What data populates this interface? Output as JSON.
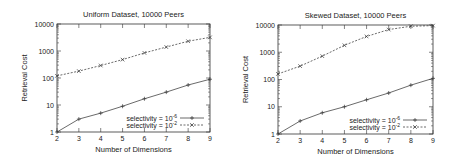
{
  "chart_data": [
    {
      "type": "line",
      "title": "Uniform Dataset, 10000 Peers",
      "xlabel": "Number of Dimensions",
      "ylabel": "Retrieval Cost",
      "yscale": "log",
      "ylim": [
        1,
        10000
      ],
      "xlim": [
        2,
        9
      ],
      "x": [
        2,
        3,
        4,
        5,
        6,
        7,
        8,
        9
      ],
      "xticks": [
        "2",
        "3",
        "4",
        "5",
        "6",
        "7",
        "8",
        "9"
      ],
      "yticks": [
        "1",
        "10",
        "100",
        "1000",
        "10000"
      ],
      "legend_position": "lower right",
      "grid": false,
      "series": [
        {
          "name": "selectivity = 10^-6",
          "style": "solid",
          "marker": "+",
          "values": [
            1,
            3,
            5,
            9,
            17,
            30,
            55,
            90
          ]
        },
        {
          "name": "selectivity = 10^-2",
          "style": "dashed",
          "marker": "x",
          "values": [
            120,
            180,
            290,
            480,
            850,
            1400,
            2300,
            3200
          ]
        }
      ]
    },
    {
      "type": "line",
      "title": "Skewed Dataset, 10000 Peers",
      "xlabel": "Number of Dimensions",
      "ylabel": "Retrieval Cost",
      "yscale": "log",
      "ylim": [
        1,
        10000
      ],
      "xlim": [
        2,
        9
      ],
      "x": [
        2,
        3,
        4,
        5,
        6,
        7,
        8,
        9
      ],
      "xticks": [
        "2",
        "3",
        "4",
        "5",
        "6",
        "7",
        "8",
        "9"
      ],
      "yticks": [
        "1",
        "10",
        "100",
        "1000",
        "10000"
      ],
      "legend_position": "lower right",
      "grid": false,
      "series": [
        {
          "name": "selectivity = 10^-6",
          "style": "solid",
          "marker": "+",
          "values": [
            1,
            3,
            6,
            10,
            18,
            32,
            62,
            110
          ]
        },
        {
          "name": "selectivity = 10^-2",
          "style": "dashed",
          "marker": "x",
          "values": [
            160,
            310,
            720,
            1800,
            3800,
            6800,
            9000,
            9500
          ]
        }
      ]
    }
  ],
  "legend": {
    "prefix": "selectivity = 10",
    "exp_a": "-6",
    "exp_b": "-2"
  }
}
